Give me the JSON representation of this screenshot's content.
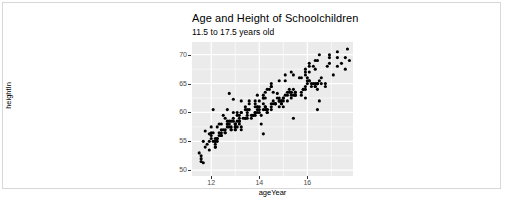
{
  "chart_data": {
    "type": "scatter",
    "title": "Age and Height of Schoolchildren",
    "subtitle": "11.5 to 17.5 years old",
    "xlabel": "ageYear",
    "ylabel": "heightIn",
    "xlim": [
      11.2,
      17.9
    ],
    "ylim": [
      49.0,
      72.2
    ],
    "xticks": [
      12,
      14,
      16
    ],
    "yticks": [
      50,
      55,
      60,
      65,
      70
    ],
    "xticks_minor": [
      13,
      15,
      17
    ],
    "yticks_minor": [
      52.5,
      57.5,
      62.5,
      67.5
    ],
    "grid": true,
    "legend": "none",
    "panel_background": "#ebebeb",
    "grid_color": "#ffffff",
    "point_color": "#000000",
    "point_size": 3.1,
    "n_points": 236,
    "series": [
      {
        "name": "schoolchildren",
        "x": [
          11.92,
          12.92,
          12.75,
          13.42,
          15.92,
          14.25,
          15.42,
          11.67,
          15.42,
          14.17,
          14.67,
          12.08,
          15.17,
          11.75,
          12.67,
          13.33,
          14.92,
          14.75,
          16.75,
          11.67,
          16.42,
          15.25,
          12.5,
          16.5,
          13.25,
          13.25,
          14.08,
          13.08,
          12.92,
          14.5,
          15.75,
          12.83,
          11.5,
          16.42,
          14.0,
          14.83,
          12.25,
          14.5,
          12.08,
          15.5,
          13.92,
          14.83,
          14.0,
          12.75,
          15.5,
          12.17,
          15.33,
          13.08,
          16.08,
          13.5,
          12.58,
          16.42,
          15.33,
          12.67,
          12.67,
          13.92,
          14.83,
          12.08,
          13.0,
          13.0,
          14.33,
          12.17,
          13.17,
          16.33,
          13.5,
          15.33,
          15.0,
          11.58,
          13.25,
          14.92,
          16.33,
          13.75,
          14.67,
          12.42,
          13.42,
          12.67,
          14.5,
          13.0,
          14.58,
          14.58,
          13.5,
          14.33,
          15.0,
          11.58,
          15.0,
          13.83,
          14.33,
          13.83,
          14.67,
          12.67,
          15.5,
          13.67,
          14.25,
          16.5,
          16.25,
          15.42,
          14.83,
          12.42,
          15.83,
          14.17,
          12.83,
          13.0,
          12.42,
          11.58,
          17.42,
          15.75,
          16.33,
          17.75,
          14.58,
          15.08,
          13.25,
          12.92,
          16.08,
          17.25,
          12.0,
          14.5,
          13.92,
          13.17,
          15.33,
          14.5,
          16.42,
          17.25,
          15.92,
          13.58,
          15.08,
          16.25,
          13.17,
          13.08,
          16.5,
          15.67,
          16.08,
          15.92,
          14.33,
          13.42,
          16.33,
          13.83,
          15.42,
          17.67,
          14.25,
          13.25,
          16.92,
          14.83,
          16.92,
          14.42,
          16.92,
          13.42,
          16.08,
          12.0,
          13.58,
          16.83,
          12.33,
          12.5,
          12.0,
          15.92,
          13.83,
          12.17,
          16.42,
          17.58,
          11.83,
          13.58,
          12.33,
          16.17,
          12.25,
          12.42,
          17.58,
          14.17,
          13.08,
          14.17,
          13.83,
          14.5,
          16.0,
          15.25,
          13.92,
          13.5,
          14.0,
          16.0,
          12.42,
          13.92,
          14.17,
          12.0,
          11.75,
          11.92,
          15.17,
          12.75,
          13.17,
          15.92,
          14.83,
          15.17,
          14.17,
          13.0,
          12.17,
          12.58,
          17.25,
          14.0,
          12.25,
          14.33,
          12.75,
          13.83,
          12.17,
          16.33,
          16.58,
          15.75,
          12.92,
          14.25,
          16.58,
          13.0,
          12.58,
          14.92,
          16.42,
          15.83,
          13.17,
          14.25,
          14.75,
          15.33,
          12.83,
          13.0,
          12.25,
          16.08,
          15.08,
          12.58,
          11.92,
          16.0,
          15.0,
          14.67,
          16.17,
          12.83,
          13.67,
          12.17,
          15.5,
          15.92,
          17.08,
          14.92,
          13.75,
          12.33,
          14.08,
          16.75
        ],
        "y": [
          56.3,
          62.3,
          63.3,
          59.0,
          62.5,
          62.5,
          59.0,
          51.3,
          64.0,
          56.3,
          61.5,
          60.5,
          62.0,
          56.8,
          60.5,
          59.0,
          61.5,
          63.3,
          64.5,
          55.0,
          60.5,
          63.5,
          59.5,
          62.0,
          57.0,
          60.0,
          58.0,
          60.0,
          59.0,
          61.5,
          63.0,
          57.0,
          53.0,
          65.0,
          61.0,
          62.0,
          55.5,
          60.5,
          56.5,
          63.0,
          60.0,
          61.0,
          60.0,
          57.5,
          63.0,
          54.0,
          62.5,
          57.5,
          65.5,
          60.5,
          59.0,
          64.0,
          63.5,
          58.0,
          58.5,
          61.0,
          62.5,
          55.0,
          57.0,
          58.0,
          60.0,
          55.5,
          58.5,
          64.5,
          59.5,
          63.5,
          61.0,
          52.5,
          57.5,
          62.0,
          65.0,
          59.5,
          61.5,
          56.0,
          59.0,
          58.0,
          61.0,
          57.0,
          61.5,
          62.0,
          59.0,
          60.5,
          62.5,
          51.5,
          62.0,
          60.0,
          60.5,
          59.5,
          61.5,
          57.5,
          63.5,
          59.0,
          61.0,
          65.5,
          65.0,
          63.0,
          62.0,
          56.5,
          64.0,
          60.5,
          57.5,
          58.0,
          56.0,
          52.0,
          68.5,
          66.0,
          67.5,
          69.0,
          63.5,
          66.5,
          62.0,
          60.0,
          68.0,
          69.5,
          57.5,
          64.5,
          63.0,
          59.5,
          67.0,
          65.0,
          69.0,
          70.5,
          67.0,
          60.5,
          65.5,
          68.0,
          58.5,
          59.5,
          70.0,
          66.0,
          68.5,
          67.5,
          64.0,
          61.0,
          69.0,
          62.0,
          66.5,
          71.0,
          63.5,
          60.0,
          70.0,
          65.5,
          69.5,
          64.0,
          68.5,
          60.5,
          67.0,
          56.5,
          61.5,
          68.0,
          58.0,
          57.0,
          56.0,
          66.5,
          61.0,
          55.0,
          65.0,
          67.5,
          54.5,
          62.0,
          56.5,
          65.0,
          57.5,
          58.0,
          69.5,
          63.0,
          58.5,
          62.5,
          61.5,
          64.5,
          66.0,
          64.0,
          61.0,
          60.0,
          62.0,
          65.5,
          57.0,
          60.5,
          62.5,
          55.5,
          54.0,
          55.0,
          63.0,
          58.5,
          59.0,
          64.5,
          62.0,
          63.5,
          61.5,
          57.5,
          54.5,
          57.0,
          68.0,
          60.5,
          55.0,
          60.0,
          58.0,
          60.0,
          54.0,
          64.5,
          65.0,
          63.5,
          58.5,
          61.0,
          66.0,
          57.5,
          56.5,
          62.0,
          65.0,
          64.0,
          58.0,
          60.5,
          62.5,
          63.0,
          58.5,
          58.0,
          55.5,
          65.5,
          63.0,
          56.5,
          53.5,
          65.0,
          62.5,
          61.5,
          64.5,
          57.0,
          59.5,
          55.0,
          63.5,
          64.0,
          66.5,
          61.5,
          59.5,
          56.0,
          59.5,
          65.0
        ]
      }
    ]
  }
}
